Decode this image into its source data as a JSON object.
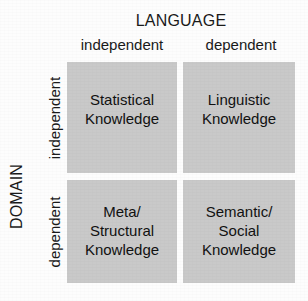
{
  "figure": {
    "type": "2x2-matrix",
    "background_color": "#fdfdfd",
    "cell_color": "#c9c9c9",
    "text_color": "#111111",
    "column_axis": {
      "title": "LANGUAGE",
      "headers": [
        "independent",
        "dependent"
      ]
    },
    "row_axis": {
      "title": "DOMAIN",
      "headers": [
        "independent",
        "dependent"
      ]
    },
    "cells": [
      {
        "row": "independent",
        "column": "independent",
        "label": "Statistical\nKnowledge"
      },
      {
        "row": "independent",
        "column": "dependent",
        "label": "Linguistic\nKnowledge"
      },
      {
        "row": "dependent",
        "column": "independent",
        "label": "Meta/\nStructural\nKnowledge"
      },
      {
        "row": "dependent",
        "column": "dependent",
        "label": "Semantic/\nSocial\nKnowledge"
      }
    ]
  }
}
